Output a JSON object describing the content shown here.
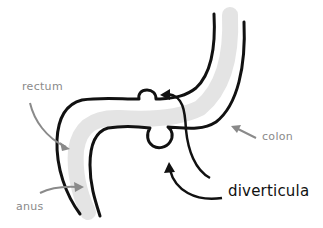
{
  "diagram": {
    "title": "",
    "labels": {
      "rectum": "rectum",
      "anus": "anus",
      "colon": "colon",
      "diverticula": "diverticula"
    },
    "colors": {
      "outline": "#111111",
      "fill": "#e6e6e6",
      "pointer_gray": "#8a8a8a",
      "pointer_dark": "#111111"
    }
  }
}
